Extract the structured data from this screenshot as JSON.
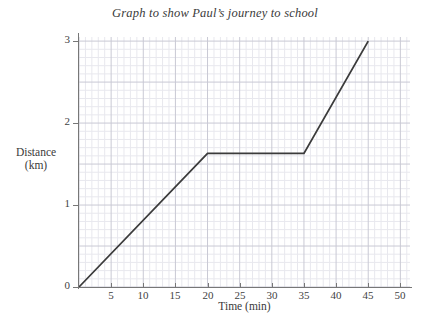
{
  "chart_data": {
    "type": "line",
    "title": "Graph to show Paul’s journey to school",
    "xlabel": "Time (min)",
    "ylabel_line1": "Distance",
    "ylabel_line2": "(km)",
    "xlim": [
      0,
      51.5
    ],
    "ylim": [
      0,
      3.05
    ],
    "xticks": [
      0,
      5,
      10,
      15,
      20,
      25,
      30,
      35,
      40,
      45,
      50
    ],
    "xtick_labels": [
      "",
      "5",
      "10",
      "15",
      "20",
      "25",
      "30",
      "35",
      "40",
      "45",
      "50"
    ],
    "yticks": [
      0,
      1,
      2,
      3
    ],
    "ytick_labels": [
      "0",
      "1",
      "2",
      "3"
    ],
    "grid": {
      "visible": true,
      "major_x_step": 5,
      "major_y_step": 0.5,
      "minor_x_step": 1,
      "minor_y_step": 0.1,
      "major_color": "#c9c9d4",
      "minor_color": "#e8e8ee"
    },
    "origin_label": "0",
    "legend": null,
    "series": [
      {
        "name": "Paul's journey",
        "color": "#3b3b3b",
        "x": [
          0,
          20,
          35,
          45
        ],
        "y": [
          0,
          1.63,
          1.63,
          3.0
        ],
        "points": [
          {
            "x": 0,
            "y": 0
          },
          {
            "x": 20,
            "y": 1.63
          },
          {
            "x": 35,
            "y": 1.63
          },
          {
            "x": 45,
            "y": 3.0
          }
        ]
      }
    ],
    "annotations": []
  }
}
